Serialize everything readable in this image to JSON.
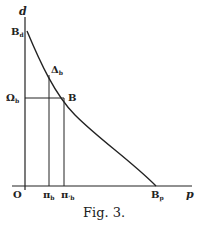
{
  "figure": {
    "caption": "Fig. 3.",
    "axes": {
      "y_label": "d",
      "x_label": "p",
      "origin": "O"
    },
    "points": {
      "B_d": {
        "main": "B",
        "sub": "d"
      },
      "Delta_b": {
        "main": "Δ",
        "sub": "b"
      },
      "B": {
        "main": "B"
      },
      "Omega_b": {
        "main": "Ω",
        "sub": "b"
      },
      "pi_b": {
        "main": "π",
        "sub": "b"
      },
      "pi_prime_b": {
        "main": "π",
        "sub": "'b"
      },
      "B_p": {
        "main": "B",
        "sub": "p"
      }
    },
    "colors": {
      "ink": "#222222",
      "background": "#ffffff"
    }
  }
}
